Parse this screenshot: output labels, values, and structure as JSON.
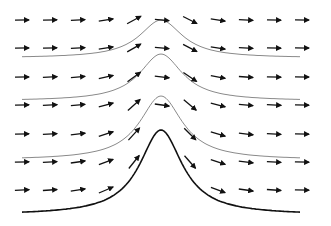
{
  "diagram": {
    "title": "",
    "colors": {
      "background": "#ffffff",
      "arrow": "#111111",
      "streamline": "#8a8a8a",
      "obstacle": "#111111"
    },
    "arrow_grid": {
      "rows_y": [
        20,
        48,
        77,
        105,
        134,
        162,
        190
      ],
      "cols_x": [
        22,
        50,
        78,
        106,
        134,
        162,
        190,
        218,
        246,
        274,
        302
      ],
      "length": 14
    },
    "streamlines": [
      {
        "base_y": 58,
        "peak_height": 38
      },
      {
        "base_y": 101,
        "peak_height": 47
      },
      {
        "base_y": 160,
        "peak_height": 64
      },
      {
        "base_y": 215,
        "peak_height": 85
      }
    ],
    "streamline_x_range": [
      22,
      300
    ],
    "peak_x": 161,
    "peak_width": 26
  }
}
